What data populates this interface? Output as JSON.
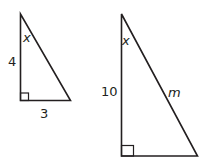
{
  "diagram": {
    "small_triangle": {
      "side_vertical_label": "4",
      "side_horizontal_label": "3",
      "angle_label": "x",
      "right_angle": true
    },
    "large_triangle": {
      "side_vertical_label": "10",
      "hypotenuse_label": "m",
      "angle_label": "x",
      "right_angle": true
    },
    "colors": {
      "stroke": "#231f20",
      "background": "#ffffff"
    }
  }
}
